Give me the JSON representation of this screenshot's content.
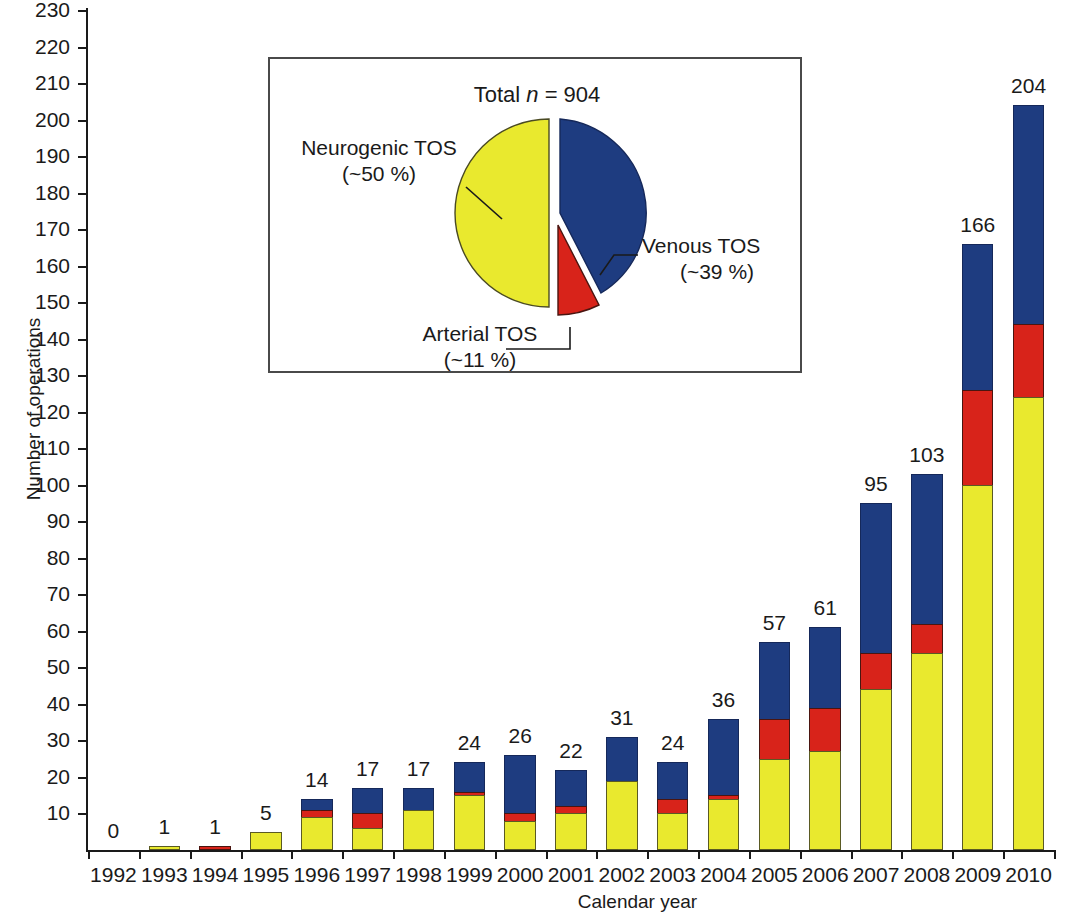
{
  "chart_data": {
    "type": "bar",
    "title": "",
    "xlabel": "Calendar year",
    "ylabel": "Number of operations",
    "ylim": [
      0,
      230
    ],
    "ytick_step": 10,
    "grid": false,
    "stacked": true,
    "legend_position": "none",
    "categories": [
      "1992",
      "1993",
      "1994",
      "1995",
      "1996",
      "1997",
      "1998",
      "1999",
      "2000",
      "2001",
      "2002",
      "2003",
      "2004",
      "2005",
      "2006",
      "2007",
      "2008",
      "2009",
      "2010"
    ],
    "yticks": [
      "10",
      "20",
      "30",
      "40",
      "50",
      "60",
      "70",
      "80",
      "90",
      "100",
      "110",
      "120",
      "130",
      "140",
      "150",
      "160",
      "170",
      "180",
      "190",
      "200",
      "210",
      "220",
      "230"
    ],
    "series": [
      {
        "name": "Neurogenic TOS",
        "color": "#e9e92e",
        "values": [
          0,
          1,
          0,
          5,
          9,
          6,
          11,
          15,
          8,
          10,
          19,
          10,
          14,
          25,
          27,
          44,
          54,
          100,
          124
        ]
      },
      {
        "name": "Arterial TOS",
        "color": "#d8231a",
        "values": [
          0,
          0,
          1,
          0,
          2,
          4,
          0,
          1,
          2,
          2,
          0,
          4,
          1,
          11,
          12,
          10,
          8,
          26,
          20
        ]
      },
      {
        "name": "Venous TOS",
        "color": "#1e3c80",
        "values": [
          0,
          0,
          0,
          0,
          3,
          7,
          6,
          8,
          16,
          10,
          12,
          10,
          21,
          21,
          22,
          41,
          41,
          40,
          60
        ]
      }
    ],
    "totals": [
      0,
      1,
      1,
      5,
      14,
      17,
      17,
      24,
      26,
      22,
      31,
      24,
      36,
      57,
      61,
      95,
      103,
      166,
      204
    ],
    "total_labels": [
      "0",
      "1",
      "1",
      "5",
      "14",
      "17",
      "17",
      "24",
      "26",
      "22",
      "31",
      "24",
      "36",
      "57",
      "61",
      "95",
      "103",
      "166",
      "204"
    ]
  },
  "inset": {
    "type": "pie",
    "total_label_prefix": "Total ",
    "total_label_italic": "n",
    "total_label_suffix": " = 904",
    "total_n": 904,
    "slices": [
      {
        "name": "Neurogenic TOS",
        "percent_label": "(~50 %)",
        "percent": 50,
        "color": "#e9e92e",
        "label": "Neurogenic TOS"
      },
      {
        "name": "Venous TOS",
        "percent_label": "(~39 %)",
        "percent": 39,
        "color": "#1e3c80",
        "label": "Venous TOS"
      },
      {
        "name": "Arterial TOS",
        "percent_label": "(~11 %)",
        "percent": 11,
        "color": "#d8231a",
        "label": "Arterial TOS",
        "exploded": true
      }
    ]
  },
  "colors": {
    "neurogenic": "#e9e92e",
    "arterial": "#d8231a",
    "venous": "#1e3c80",
    "axis": "#1a1a1a",
    "inset_border": "#4a4a4a",
    "background": "#ffffff"
  }
}
